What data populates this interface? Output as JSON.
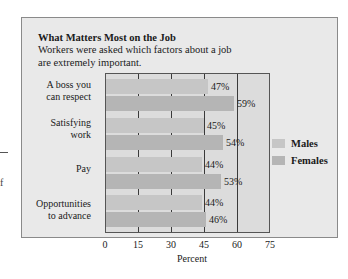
{
  "stray": {
    "dash": "",
    "letter": "f"
  },
  "chart_data": {
    "type": "bar",
    "orientation": "horizontal",
    "title": "What Matters Most on the Job",
    "subtitle": "Workers were asked which factors about a job are extremely important.",
    "categories": [
      "A boss you can respect",
      "Satisfying work",
      "Pay",
      "Opportunities to advance"
    ],
    "category_lines": [
      [
        "A boss you",
        "can respect"
      ],
      [
        "Satisfying",
        "work"
      ],
      [
        "Pay"
      ],
      [
        "Opportunities",
        "to advance"
      ]
    ],
    "series": [
      {
        "name": "Males",
        "values": [
          47,
          45,
          44,
          44
        ],
        "labels": [
          "47%",
          "45%",
          "44%",
          "44%"
        ],
        "color": "#c6c6c6"
      },
      {
        "name": "Females",
        "values": [
          59,
          54,
          53,
          46
        ],
        "labels": [
          "59%",
          "54%",
          "53%",
          "46%"
        ],
        "color": "#b5b5b5"
      }
    ],
    "xlabel": "Percent",
    "ylabel": "",
    "xlim": [
      0,
      75
    ],
    "xticks": [
      "0",
      "15",
      "30",
      "45",
      "60",
      "75"
    ],
    "grid": true,
    "legend_position": "right"
  }
}
